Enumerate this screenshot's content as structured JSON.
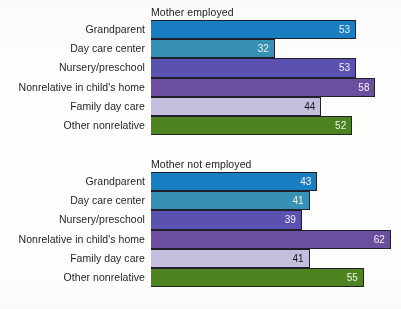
{
  "chart_data": [
    {
      "type": "bar",
      "orientation": "horizontal",
      "title": "Mother employed",
      "categories": [
        "Grandparent",
        "Day care center",
        "Nursery/preschool",
        "Nonrelative in child's home",
        "Family day care",
        "Other nonrelative"
      ],
      "values": [
        53,
        32,
        53,
        58,
        44,
        52
      ],
      "colors": [
        "#1a7ec3",
        "#3691b4",
        "#5b51b0",
        "#6b4f9e",
        "#c3bedd",
        "#4d8420"
      ],
      "label_on_dark": [
        true,
        true,
        true,
        true,
        false,
        true
      ],
      "xlabel": "",
      "ylabel": "",
      "xlim": [
        0,
        65
      ],
      "grid": false,
      "legend": "none"
    },
    {
      "type": "bar",
      "orientation": "horizontal",
      "title": "Mother not employed",
      "categories": [
        "Grandparent",
        "Day care center",
        "Nursery/preschool",
        "Nonrelative in child's home",
        "Family day care",
        "Other nonrelative"
      ],
      "values": [
        43,
        41,
        39,
        62,
        41,
        55
      ],
      "colors": [
        "#1a7ec3",
        "#3691b4",
        "#5b51b0",
        "#6b4f9e",
        "#c3bedd",
        "#4d8420"
      ],
      "label_on_dark": [
        true,
        true,
        true,
        true,
        false,
        true
      ],
      "xlabel": "",
      "ylabel": "",
      "xlim": [
        0,
        65
      ],
      "grid": false,
      "legend": "none"
    }
  ],
  "panels": [
    {
      "title": "Mother employed",
      "rows": [
        {
          "label": "Grandparent",
          "value": "53",
          "color": "#1a7ec3",
          "dark": true
        },
        {
          "label": "Day care center",
          "value": "32",
          "color": "#3691b4",
          "dark": true
        },
        {
          "label": "Nursery/preschool",
          "value": "53",
          "color": "#5b51b0",
          "dark": true
        },
        {
          "label": "Nonrelative in child's home",
          "value": "58",
          "color": "#6b4f9e",
          "dark": true
        },
        {
          "label": "Family day care",
          "value": "44",
          "color": "#c3bedd",
          "dark": false
        },
        {
          "label": "Other nonrelative",
          "value": "52",
          "color": "#4d8420",
          "dark": true
        }
      ]
    },
    {
      "title": "Mother not employed",
      "rows": [
        {
          "label": "Grandparent",
          "value": "43",
          "color": "#1a7ec3",
          "dark": true
        },
        {
          "label": "Day care center",
          "value": "41",
          "color": "#3691b4",
          "dark": true
        },
        {
          "label": "Nursery/preschool",
          "value": "39",
          "color": "#5b51b0",
          "dark": true
        },
        {
          "label": "Nonrelative in child's home",
          "value": "62",
          "color": "#6b4f9e",
          "dark": true
        },
        {
          "label": "Family day care",
          "value": "41",
          "color": "#c3bedd",
          "dark": false
        },
        {
          "label": "Other nonrelative",
          "value": "55",
          "color": "#4d8420",
          "dark": true
        }
      ]
    }
  ],
  "scale": {
    "axis_left_px": 151,
    "px_per_unit": 3.87,
    "xmax": 65
  }
}
